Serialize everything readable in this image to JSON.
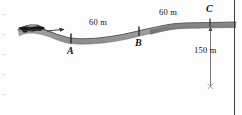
{
  "figure": {
    "type": "physics-road-profile-diagram",
    "title_text": "",
    "points": [
      {
        "id": "A",
        "label": "A",
        "x": 71,
        "y": 38,
        "label_x": 67,
        "label_y": 45
      },
      {
        "id": "B",
        "label": "B",
        "x": 139,
        "y": 31,
        "label_x": 135,
        "label_y": 38
      },
      {
        "id": "C",
        "label": "C",
        "x": 209,
        "y": 23,
        "label_x": 205,
        "label_y": 6
      }
    ],
    "dimension_labels": [
      {
        "id": "AB",
        "text": "60 m",
        "x": 98,
        "y": 23
      },
      {
        "id": "BC",
        "text": "60 m",
        "x": 168,
        "y": 13
      },
      {
        "id": "drop",
        "text": "150 m",
        "x": 200,
        "y": 46
      }
    ],
    "vehicle": {
      "name": "car",
      "x": 30,
      "y": 28,
      "direction_arrow": "right"
    },
    "drop_arrow": {
      "from_y": 26,
      "to_y": 86,
      "x": 211,
      "terminator": "x-mark"
    },
    "colors": {
      "road_fill": "#9a9a9a",
      "road_top": "#5e5e5e",
      "text": "#141414",
      "rule": "#3c3c3c",
      "background": "#fdfdfd",
      "vehicle_body": "#1c1c1c"
    },
    "road_path_note": "S-shaped profile descending from left to A, flat A to B, rising B to C, level at C"
  }
}
